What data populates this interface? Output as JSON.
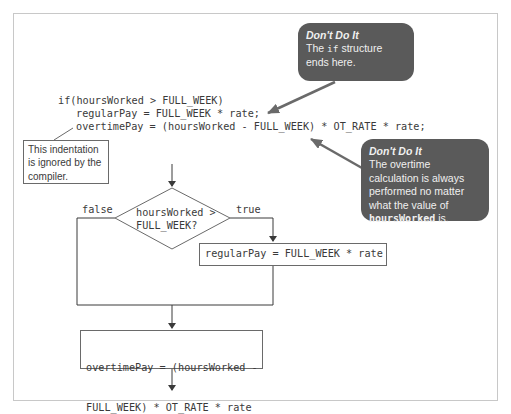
{
  "code": {
    "line1": "if(hoursWorked > FULL_WEEK)",
    "line2": "regularPay = FULL_WEEK * rate;",
    "line3": "overtimePay = (hoursWorked - FULL_WEEK) * OT_RATE * rate;"
  },
  "callout_top": {
    "title": "Don't Do It",
    "text_before": "The ",
    "text_code": "if",
    "text_after": " structure ends here."
  },
  "callout_right": {
    "title": "Don't Do It",
    "text_before": "The overtime calculation is always performed no matter what the value of ",
    "text_code": "hoursWorked",
    "text_after": " is."
  },
  "note": {
    "text": "This indentation is ignored by the compiler."
  },
  "flowchart": {
    "decision_line1": "hoursWorked >",
    "decision_line2": "FULL_WEEK?",
    "false_label": "false",
    "true_label": "true",
    "regular_box": "regularPay = FULL_WEEK * rate",
    "overtime_box_line1": "overtimePay = (hoursWorked -",
    "overtime_box_line2": "FULL_WEEK) * OT_RATE * rate"
  },
  "colors": {
    "callout_bg": "#5a5a5a",
    "arrow": "#6a6a6a",
    "line": "#3a3a3a",
    "frame": "#c8c8c8"
  }
}
